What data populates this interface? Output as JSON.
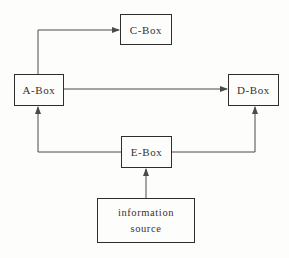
{
  "diagram": {
    "type": "flow-diagram",
    "nodes": {
      "c_box": {
        "label": "C-Box"
      },
      "a_box": {
        "label": "A-Box"
      },
      "d_box": {
        "label": "D-Box"
      },
      "e_box": {
        "label": "E-Box"
      },
      "information_source": {
        "label_line1": "information",
        "label_line2": "source"
      }
    },
    "edges": [
      {
        "from": "a_box",
        "to": "c_box",
        "route": "up-then-right",
        "arrow_into": "left side of C-Box"
      },
      {
        "from": "a_box",
        "to": "d_box",
        "route": "straight-right",
        "arrow_into": "left side of D-Box"
      },
      {
        "from": "e_box",
        "to": "a_box",
        "route": "left-then-up",
        "arrow_into": "bottom of A-Box"
      },
      {
        "from": "e_box",
        "to": "d_box",
        "route": "right-then-up",
        "arrow_into": "bottom of D-Box"
      },
      {
        "from": "information_source",
        "to": "e_box",
        "route": "straight-up",
        "arrow_into": "bottom of E-Box"
      }
    ],
    "colors": {
      "line": "#4a4a4a",
      "box_border": "#2e2e2e",
      "text": "#333333",
      "background": "#fdfdfb"
    }
  }
}
